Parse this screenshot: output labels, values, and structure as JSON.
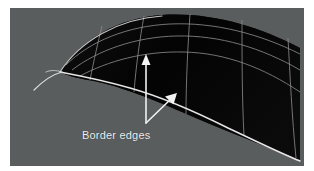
{
  "figure": {
    "type": "3d-surface-diagram",
    "panel_background_color": "#5a5d5d",
    "page_background_color": "#ffffff",
    "annotation": {
      "label": "Border edges",
      "label_color": "#efefef",
      "arrow_color": "#f2f2f2",
      "arrow_count": 2,
      "arrows": [
        {
          "name": "vertical-arrow",
          "description": "points up to the upper border edge of the surface",
          "x1": 136,
          "y1": 115,
          "x2": 136,
          "y2": 50
        },
        {
          "name": "diagonal-arrow",
          "description": "points up-right to the lower border edge of the surface",
          "x1": 136,
          "y1": 115,
          "x2": 165,
          "y2": 87
        }
      ]
    },
    "surface": {
      "name": "nurbs-patch",
      "fill_color": "#050505",
      "isocurve_color": "#9a9a9a",
      "border_edge_color": "#e8e8e8",
      "u_divisions": 5,
      "v_divisions": 4,
      "tail_whisker": true
    }
  }
}
